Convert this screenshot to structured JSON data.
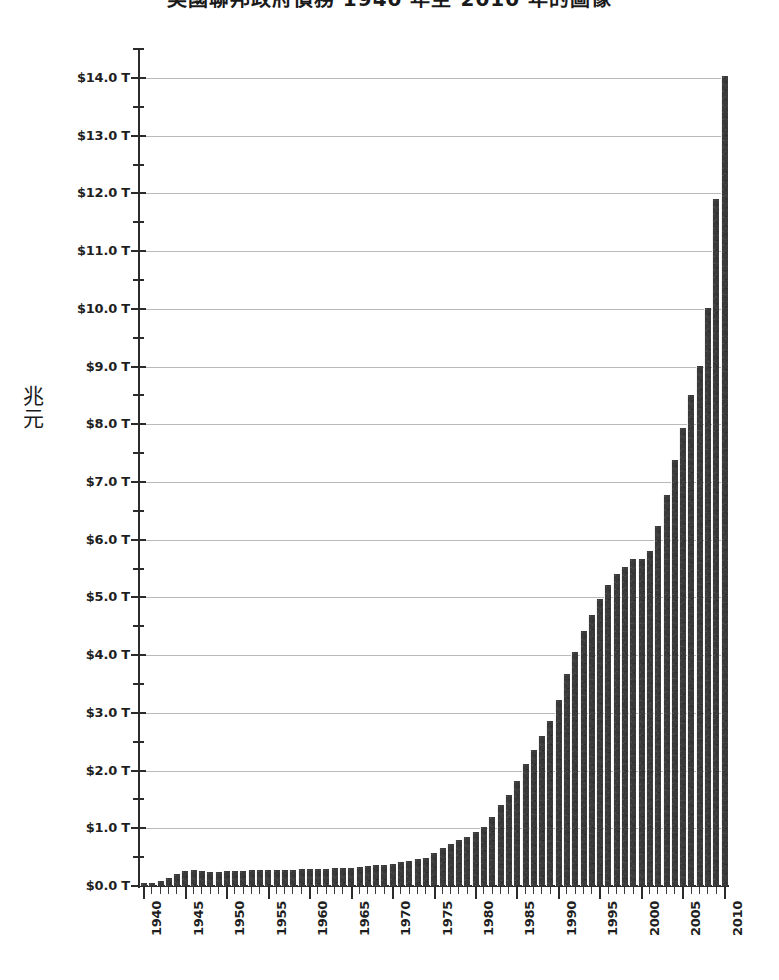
{
  "chart_title": "美國聯邦政府債務 1940 年至 2010 年的圖像",
  "y_axis_title_chars": [
    "兆",
    "元"
  ],
  "y_axis_title": "兆元",
  "colors": {
    "bar": "#3a3a3a",
    "gridline": "#b9b9b9",
    "axis": "#2b2b2b",
    "background": "#ffffff",
    "text": "#1f1f1f"
  },
  "chart_data": {
    "type": "bar",
    "title": "美國聯邦政府債務 1940 年至 2010 年的圖像",
    "xlabel": "",
    "ylabel": "兆元",
    "ylim": [
      0,
      14.6
    ],
    "xlim": [
      1939.5,
      2010.5
    ],
    "grid": true,
    "legend": null,
    "y_tick_labels": [
      "$0.0 T",
      "$1.0 T",
      "$2.0 T",
      "$3.0 T",
      "$4.0 T",
      "$5.0 T",
      "$6.0 T",
      "$7.0 T",
      "$8.0 T",
      "$9.0 T",
      "$10.0 T",
      "$11.0 T",
      "$12.0 T",
      "$13.0 T",
      "$14.0 T"
    ],
    "y_tick_values": [
      0,
      1,
      2,
      3,
      4,
      5,
      6,
      7,
      8,
      9,
      10,
      11,
      12,
      13,
      14
    ],
    "y_minor_tick_values": [
      0.5,
      1.5,
      2.5,
      3.5,
      4.5,
      5.5,
      6.5,
      7.5,
      8.5,
      9.5,
      10.5,
      11.5,
      12.5,
      13.5,
      14.5
    ],
    "x_tick_labels": [
      "1940",
      "1945",
      "1950",
      "1955",
      "1960",
      "1965",
      "1970",
      "1975",
      "1980",
      "1985",
      "1990",
      "1995",
      "2000",
      "2005",
      "2010"
    ],
    "x_tick_values": [
      1940,
      1945,
      1950,
      1955,
      1960,
      1965,
      1970,
      1975,
      1980,
      1985,
      1990,
      1995,
      2000,
      2005,
      2010
    ],
    "categories": [
      1940,
      1941,
      1942,
      1943,
      1944,
      1945,
      1946,
      1947,
      1948,
      1949,
      1950,
      1951,
      1952,
      1953,
      1954,
      1955,
      1956,
      1957,
      1958,
      1959,
      1960,
      1961,
      1962,
      1963,
      1964,
      1965,
      1966,
      1967,
      1968,
      1969,
      1970,
      1971,
      1972,
      1973,
      1974,
      1975,
      1976,
      1977,
      1978,
      1979,
      1980,
      1981,
      1982,
      1983,
      1984,
      1985,
      1986,
      1987,
      1988,
      1989,
      1990,
      1991,
      1992,
      1993,
      1994,
      1995,
      1996,
      1997,
      1998,
      1999,
      2000,
      2001,
      2002,
      2003,
      2004,
      2005,
      2006,
      2007,
      2008,
      2009,
      2010
    ],
    "values": [
      0.05,
      0.06,
      0.08,
      0.14,
      0.2,
      0.26,
      0.27,
      0.26,
      0.25,
      0.25,
      0.26,
      0.26,
      0.26,
      0.27,
      0.27,
      0.27,
      0.27,
      0.27,
      0.28,
      0.29,
      0.29,
      0.29,
      0.3,
      0.31,
      0.32,
      0.32,
      0.33,
      0.34,
      0.36,
      0.37,
      0.38,
      0.41,
      0.44,
      0.47,
      0.49,
      0.58,
      0.65,
      0.72,
      0.79,
      0.85,
      0.93,
      1.03,
      1.19,
      1.4,
      1.58,
      1.82,
      2.12,
      2.35,
      2.6,
      2.86,
      3.23,
      3.67,
      4.06,
      4.41,
      4.69,
      4.97,
      5.22,
      5.41,
      5.53,
      5.66,
      5.67,
      5.81,
      6.23,
      6.78,
      7.38,
      7.93,
      8.51,
      9.01,
      10.02,
      11.91,
      14.03
    ],
    "units": "trillions of dollars",
    "value_prefix": "$",
    "value_suffix": " T"
  }
}
